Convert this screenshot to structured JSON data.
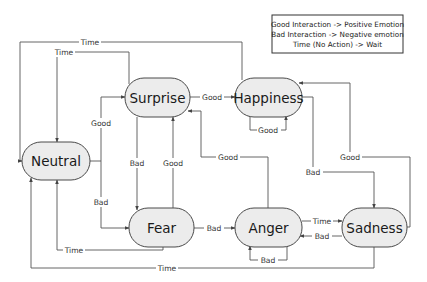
{
  "legend": {
    "lines": [
      "Good Interaction -> Positive Emotion",
      "Bad Interaction -> Negative emotion",
      "Time (No Action) -> Wait"
    ]
  },
  "nodes": {
    "neutral": "Neutral",
    "surprise": "Surprise",
    "happiness": "Happiness",
    "fear": "Fear",
    "anger": "Anger",
    "sadness": "Sadness"
  },
  "edges": [
    {
      "id": "happiness-to-neutral-time",
      "from": "Happiness",
      "to": "Neutral",
      "label": "Time"
    },
    {
      "id": "surprise-to-neutral-time",
      "from": "Surprise",
      "to": "Neutral",
      "label": "Time"
    },
    {
      "id": "neutral-to-surprise-good",
      "from": "Neutral",
      "to": "Surprise",
      "label": "Good"
    },
    {
      "id": "neutral-to-fear-bad",
      "from": "Neutral",
      "to": "Fear",
      "label": "Bad"
    },
    {
      "id": "surprise-to-happiness-good",
      "from": "Surprise",
      "to": "Happiness",
      "label": "Good"
    },
    {
      "id": "happiness-self-good",
      "from": "Happiness",
      "to": "Happiness",
      "label": "Good"
    },
    {
      "id": "surprise-to-fear-bad",
      "from": "Surprise",
      "to": "Fear",
      "label": "Bad"
    },
    {
      "id": "fear-to-surprise-good",
      "from": "Fear",
      "to": "Surprise",
      "label": "Good"
    },
    {
      "id": "anger-to-surprise-good",
      "from": "Anger",
      "to": "Surprise",
      "label": "Good"
    },
    {
      "id": "happiness-to-sadness-bad",
      "from": "Happiness",
      "to": "Sadness",
      "label": "Bad"
    },
    {
      "id": "sadness-to-happiness-good",
      "from": "Sadness",
      "to": "Happiness",
      "label": "Good"
    },
    {
      "id": "fear-to-anger-bad",
      "from": "Fear",
      "to": "Anger",
      "label": "Bad"
    },
    {
      "id": "anger-to-sadness-time",
      "from": "Anger",
      "to": "Sadness",
      "label": "Time"
    },
    {
      "id": "sadness-to-anger-bad",
      "from": "Sadness",
      "to": "Anger",
      "label": "Bad"
    },
    {
      "id": "anger-self-bad",
      "from": "Anger",
      "to": "Anger",
      "label": "Bad"
    },
    {
      "id": "fear-to-neutral-time",
      "from": "Fear",
      "to": "Neutral",
      "label": "Time"
    },
    {
      "id": "sadness-to-neutral-time",
      "from": "Sadness",
      "to": "Neutral",
      "label": "Time"
    }
  ],
  "colors": {
    "node_fill": "#ececec",
    "node_stroke": "#4a4a4a",
    "edge": "#555555",
    "background": "#ffffff"
  }
}
